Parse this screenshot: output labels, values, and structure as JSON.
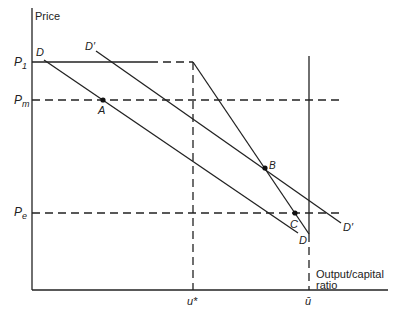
{
  "axes": {
    "y_label": "Price",
    "x_label_line1": "Output/capital",
    "x_label_line2": "ratio"
  },
  "price_levels": {
    "p1": "P",
    "p1_sub": "1",
    "pm": "P",
    "pm_sub": "m",
    "pe": "P",
    "pe_sub": "e"
  },
  "x_ticks": {
    "u_star": "u*",
    "u_bar": "ū"
  },
  "curves": {
    "d_top": "D",
    "d_bottom": "D",
    "dprime_top": "D′",
    "dprime_bottom": "D′"
  },
  "points": {
    "a": "A",
    "b": "B",
    "c": "C"
  }
}
